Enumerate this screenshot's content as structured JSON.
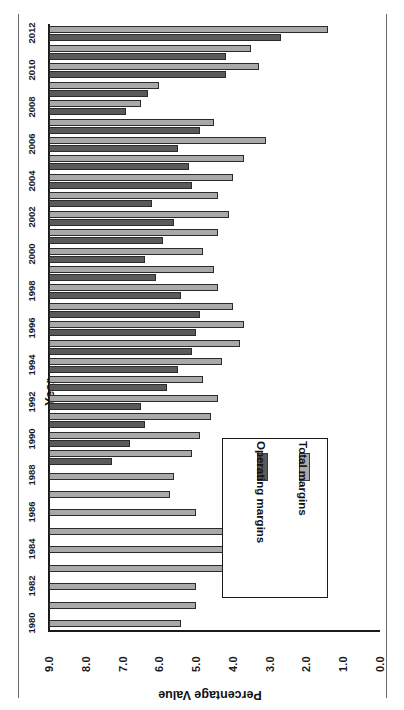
{
  "figure": {
    "rotation_degrees": 180,
    "background": "#ffffff",
    "frame_color": "#6b6b6b"
  },
  "legend": {
    "position": "inside-plot-left",
    "entries": [
      {
        "label": "Total margins",
        "color": "#a9a9a9",
        "swatch_name": "total-margins-swatch"
      },
      {
        "label": "Operating margins",
        "color": "#5a5a5a",
        "swatch_name": "operating-margins-swatch"
      }
    ]
  },
  "axes": {
    "value_axis_title": "Percentage Value",
    "category_axis_title": "Year",
    "value_ticks": [
      "0.0",
      "1.0",
      "2.0",
      "3.0",
      "4.0",
      "5.0",
      "6.0",
      "7.0",
      "8.0",
      "9.0"
    ],
    "category_ticks": [
      "1980",
      "1982",
      "1984",
      "1986",
      "1988",
      "1990",
      "1992",
      "1994",
      "1996",
      "1998",
      "2000",
      "2002",
      "2004",
      "2006",
      "2008",
      "2010",
      "2012"
    ]
  },
  "chart_data": {
    "type": "bar",
    "title": "",
    "subtitle": "",
    "xlabel": "Year",
    "ylabel": "Percentage Value",
    "ylim": [
      0.0,
      9.0
    ],
    "grid": false,
    "legend_position": "inside-left",
    "orientation": "horizontal-bars-rotated-180",
    "categories": [
      "1980",
      "1981",
      "1982",
      "1983",
      "1984",
      "1985",
      "1986",
      "1987",
      "1988",
      "1989",
      "1990",
      "1991",
      "1992",
      "1993",
      "1994",
      "1995",
      "1996",
      "1997",
      "1998",
      "1999",
      "2000",
      "2001",
      "2002",
      "2003",
      "2004",
      "2005",
      "2006",
      "2007",
      "2008",
      "2009",
      "2010",
      "2011",
      "2012"
    ],
    "series": [
      {
        "name": "Total margins",
        "color": "#a9a9a9",
        "values": [
          3.6,
          4.0,
          4.0,
          5.0,
          5.9,
          5.3,
          4.0,
          3.3,
          3.4,
          3.9,
          4.1,
          4.4,
          4.6,
          4.2,
          4.7,
          5.2,
          5.3,
          5.0,
          4.6,
          4.5,
          4.2,
          4.6,
          4.9,
          4.6,
          5.0,
          5.3,
          5.9,
          4.5,
          2.5,
          3.0,
          5.7,
          5.5,
          7.6
        ]
      },
      {
        "name": "Operating margins",
        "color": "#5a5a5a",
        "values": [
          0.0,
          0.0,
          0.0,
          0.0,
          0.0,
          0.0,
          0.0,
          0.0,
          0.0,
          1.7,
          2.2,
          2.6,
          2.5,
          3.2,
          3.5,
          3.9,
          4.0,
          4.1,
          3.6,
          2.9,
          2.6,
          3.1,
          3.4,
          2.8,
          3.9,
          3.8,
          3.5,
          4.1,
          2.1,
          2.7,
          4.8,
          4.8,
          6.3
        ]
      }
    ]
  }
}
